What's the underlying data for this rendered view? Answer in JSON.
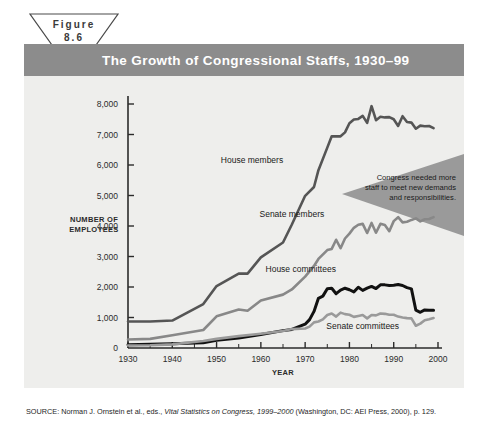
{
  "figure": {
    "badge_line1": "Figure",
    "badge_line2": "8.6",
    "title": "The Growth of Congressional Staffs, 1930–99"
  },
  "callout": {
    "line1": "Congress needed more",
    "line2": "staff to meet new demands",
    "line3": "and responsibilities."
  },
  "source": {
    "prefix": "SOURCE: Norman J. Ornstein et al., eds., ",
    "italic": "Vital Statistics on Congress, 1999–2000",
    "suffix": " (Washington, DC: AEI Press, 2000), p. 129."
  },
  "colors": {
    "title_bar": "#8c8c8c",
    "panel": "#eeeeec",
    "house_members": "#555555",
    "senate_members": "#888888",
    "house_committees": "#111111",
    "senate_committees": "#9a9a9a",
    "callout_fill": "#9a9a9a",
    "axis": "#2b2b2b"
  },
  "chart_data": {
    "type": "line",
    "title": "The Growth of Congressional Staffs, 1930–99",
    "xlabel": "YEAR",
    "ylabel": "NUMBER OF EMPLOYEES",
    "xlim": [
      1930,
      2000
    ],
    "ylim": [
      0,
      8000
    ],
    "xticks": [
      1930,
      1940,
      1950,
      1960,
      1970,
      1980,
      1990,
      2000
    ],
    "xtick_labels": [
      "1930",
      "1940",
      "1950",
      "1960",
      "1970",
      "1980",
      "1990",
      "2000"
    ],
    "yticks": [
      0,
      1000,
      2000,
      3000,
      4000,
      5000,
      6000,
      7000,
      8000
    ],
    "ytick_labels": [
      "0",
      "1,000",
      "2,000",
      "3,000",
      "4,000",
      "5,000",
      "6,000",
      "7,000",
      "8,000"
    ],
    "grid": false,
    "legend": "inline-labels",
    "series": [
      {
        "name": "House members",
        "color": "#555555",
        "label_x": 1958,
        "label_y": 6050,
        "points": [
          [
            1930,
            870
          ],
          [
            1935,
            870
          ],
          [
            1940,
            900
          ],
          [
            1947,
            1440
          ],
          [
            1950,
            2030
          ],
          [
            1955,
            2440
          ],
          [
            1957,
            2440
          ],
          [
            1960,
            2970
          ],
          [
            1965,
            3460
          ],
          [
            1967,
            4050
          ],
          [
            1970,
            4990
          ],
          [
            1972,
            5280
          ],
          [
            1973,
            5830
          ],
          [
            1975,
            6570
          ],
          [
            1976,
            6940
          ],
          [
            1977,
            6940
          ],
          [
            1978,
            6940
          ],
          [
            1979,
            7070
          ],
          [
            1980,
            7370
          ],
          [
            1981,
            7490
          ],
          [
            1982,
            7510
          ],
          [
            1983,
            7610
          ],
          [
            1984,
            7380
          ],
          [
            1985,
            7930
          ],
          [
            1986,
            7470
          ],
          [
            1987,
            7580
          ],
          [
            1988,
            7560
          ],
          [
            1989,
            7570
          ],
          [
            1990,
            7500
          ],
          [
            1991,
            7280
          ],
          [
            1992,
            7600
          ],
          [
            1993,
            7410
          ],
          [
            1994,
            7390
          ],
          [
            1995,
            7190
          ],
          [
            1996,
            7290
          ],
          [
            1997,
            7270
          ],
          [
            1998,
            7280
          ],
          [
            1999,
            7210
          ]
        ]
      },
      {
        "name": "Senate members",
        "color": "#888888",
        "label_x": 1967,
        "label_y": 4300,
        "points": [
          [
            1930,
            280
          ],
          [
            1935,
            300
          ],
          [
            1940,
            420
          ],
          [
            1947,
            590
          ],
          [
            1950,
            1040
          ],
          [
            1955,
            1260
          ],
          [
            1957,
            1220
          ],
          [
            1960,
            1560
          ],
          [
            1965,
            1750
          ],
          [
            1967,
            1920
          ],
          [
            1970,
            2340
          ],
          [
            1972,
            2690
          ],
          [
            1973,
            2920
          ],
          [
            1975,
            3210
          ],
          [
            1976,
            3250
          ],
          [
            1977,
            3550
          ],
          [
            1978,
            3270
          ],
          [
            1979,
            3590
          ],
          [
            1980,
            3750
          ],
          [
            1981,
            3940
          ],
          [
            1982,
            4040
          ],
          [
            1983,
            4070
          ],
          [
            1984,
            3770
          ],
          [
            1985,
            4100
          ],
          [
            1986,
            3780
          ],
          [
            1987,
            4070
          ],
          [
            1988,
            4030
          ],
          [
            1989,
            3830
          ],
          [
            1990,
            4160
          ],
          [
            1991,
            4290
          ],
          [
            1992,
            4120
          ],
          [
            1993,
            4140
          ],
          [
            1994,
            4200
          ],
          [
            1995,
            4250
          ],
          [
            1996,
            4150
          ],
          [
            1997,
            4220
          ],
          [
            1998,
            4230
          ],
          [
            1999,
            4290
          ]
        ]
      },
      {
        "name": "House committees",
        "color": "#111111",
        "label_x": 1969,
        "label_y": 2480,
        "points": [
          [
            1930,
            110
          ],
          [
            1935,
            120
          ],
          [
            1940,
            140
          ],
          [
            1947,
            170
          ],
          [
            1950,
            250
          ],
          [
            1955,
            330
          ],
          [
            1960,
            440
          ],
          [
            1965,
            570
          ],
          [
            1967,
            610
          ],
          [
            1970,
            780
          ],
          [
            1971,
            930
          ],
          [
            1972,
            1200
          ],
          [
            1973,
            1630
          ],
          [
            1974,
            1700
          ],
          [
            1975,
            1940
          ],
          [
            1976,
            1960
          ],
          [
            1977,
            1780
          ],
          [
            1978,
            1900
          ],
          [
            1979,
            1960
          ],
          [
            1980,
            1910
          ],
          [
            1981,
            1840
          ],
          [
            1982,
            1990
          ],
          [
            1983,
            1890
          ],
          [
            1984,
            1960
          ],
          [
            1985,
            2020
          ],
          [
            1986,
            1950
          ],
          [
            1987,
            2070
          ],
          [
            1988,
            2070
          ],
          [
            1989,
            2050
          ],
          [
            1990,
            2060
          ],
          [
            1991,
            2080
          ],
          [
            1992,
            2050
          ],
          [
            1993,
            1980
          ],
          [
            1994,
            1940
          ],
          [
            1995,
            1240
          ],
          [
            1996,
            1170
          ],
          [
            1997,
            1250
          ],
          [
            1998,
            1240
          ],
          [
            1999,
            1240
          ]
        ]
      },
      {
        "name": "Senate committees",
        "color": "#9a9a9a",
        "label_x": 1983,
        "label_y": 620,
        "points": [
          [
            1930,
            80
          ],
          [
            1935,
            90
          ],
          [
            1940,
            120
          ],
          [
            1947,
            230
          ],
          [
            1950,
            300
          ],
          [
            1955,
            390
          ],
          [
            1960,
            470
          ],
          [
            1965,
            560
          ],
          [
            1967,
            620
          ],
          [
            1970,
            640
          ],
          [
            1971,
            700
          ],
          [
            1972,
            840
          ],
          [
            1973,
            870
          ],
          [
            1974,
            940
          ],
          [
            1975,
            1080
          ],
          [
            1976,
            1130
          ],
          [
            1977,
            1030
          ],
          [
            1978,
            1160
          ],
          [
            1979,
            1110
          ],
          [
            1980,
            1090
          ],
          [
            1981,
            1020
          ],
          [
            1982,
            1050
          ],
          [
            1983,
            1080
          ],
          [
            1984,
            970
          ],
          [
            1985,
            1080
          ],
          [
            1986,
            1070
          ],
          [
            1987,
            1130
          ],
          [
            1988,
            1120
          ],
          [
            1989,
            1090
          ],
          [
            1990,
            1090
          ],
          [
            1991,
            1030
          ],
          [
            1992,
            1000
          ],
          [
            1993,
            980
          ],
          [
            1994,
            970
          ],
          [
            1995,
            730
          ],
          [
            1996,
            800
          ],
          [
            1997,
            910
          ],
          [
            1998,
            940
          ],
          [
            1999,
            980
          ]
        ]
      }
    ]
  }
}
